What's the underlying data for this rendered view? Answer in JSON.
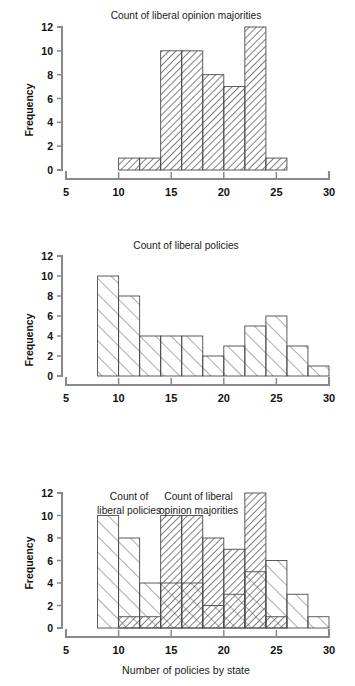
{
  "figure": {
    "xlabel": "Number of policies by state",
    "ylabel": "Frequency",
    "series_names": {
      "policies": "Count of liberal policies",
      "majorities": "Count of liberal opinion majorities"
    },
    "colors": {
      "ink": "#111111",
      "axis": "#8a8a8a",
      "bar_stroke": "#4a4a4a"
    }
  },
  "chart_data": [
    {
      "type": "bar",
      "id": "panel-1",
      "title": "Count of liberal opinion majorities",
      "xlabel": "",
      "ylabel": "Frequency",
      "xlim": [
        5,
        30
      ],
      "ylim": [
        0,
        12
      ],
      "xticks": [
        5,
        10,
        15,
        20,
        25,
        30
      ],
      "yticks": [
        0,
        2,
        4,
        6,
        8,
        10,
        12
      ],
      "xtick_labels": [
        "5",
        "10",
        "15",
        "20",
        "25",
        "30"
      ],
      "ytick_labels": [
        "0",
        "2",
        "4",
        "6",
        "8",
        "10",
        "12"
      ],
      "grid": false,
      "legend": "none",
      "bin_width": 2,
      "bin_edges": [
        10,
        12,
        14,
        16,
        18,
        20,
        22,
        24,
        26
      ],
      "categories": [
        "10-12",
        "12-14",
        "14-16",
        "16-18",
        "18-20",
        "20-22",
        "22-24",
        "24-26"
      ],
      "values": [
        1,
        1,
        10,
        10,
        8,
        7,
        12,
        1
      ],
      "hatch": "dense-backslash"
    },
    {
      "type": "bar",
      "id": "panel-2",
      "title": "Count of liberal policies",
      "xlabel": "",
      "ylabel": "Frequency",
      "xlim": [
        5,
        30
      ],
      "ylim": [
        0,
        12
      ],
      "xticks": [
        5,
        10,
        15,
        20,
        25,
        30
      ],
      "yticks": [
        0,
        2,
        4,
        6,
        8,
        10,
        12
      ],
      "xtick_labels": [
        "5",
        "10",
        "15",
        "20",
        "25",
        "30"
      ],
      "ytick_labels": [
        "0",
        "2",
        "4",
        "6",
        "8",
        "10",
        "12"
      ],
      "grid": false,
      "legend": "none",
      "bin_width": 2,
      "bin_edges": [
        8,
        10,
        12,
        14,
        16,
        18,
        20,
        22,
        24,
        26,
        28,
        30
      ],
      "categories": [
        "8-10",
        "10-12",
        "12-14",
        "14-16",
        "16-18",
        "18-20",
        "20-22",
        "22-24",
        "24-26",
        "26-28",
        "28-30"
      ],
      "values": [
        10,
        8,
        4,
        4,
        4,
        2,
        3,
        5,
        6,
        3,
        1
      ],
      "hatch": "sparse-slash"
    },
    {
      "type": "bar",
      "id": "panel-3",
      "title": "",
      "xlabel": "Number of policies by state",
      "ylabel": "Frequency",
      "xlim": [
        5,
        30
      ],
      "ylim": [
        0,
        12
      ],
      "xticks": [
        5,
        10,
        15,
        20,
        25,
        30
      ],
      "yticks": [
        0,
        2,
        4,
        6,
        8,
        10,
        12
      ],
      "xtick_labels": [
        "5",
        "10",
        "15",
        "20",
        "25",
        "30"
      ],
      "ytick_labels": [
        "0",
        "2",
        "4",
        "6",
        "8",
        "10",
        "12"
      ],
      "grid": false,
      "legend": "inline-annotations",
      "bin_width": 2,
      "annotations": [
        {
          "text_line1": "Count of",
          "text_line2": "liberal policies",
          "x": 11.0,
          "y": 11.4
        },
        {
          "text_line1": "Count of liberal",
          "text_line2": "opinion majorities",
          "x": 17.6,
          "y": 11.4
        }
      ],
      "series": [
        {
          "name": "Count of liberal policies",
          "hatch": "sparse-slash",
          "bin_edges": [
            8,
            10,
            12,
            14,
            16,
            18,
            20,
            22,
            24,
            26,
            28,
            30
          ],
          "categories": [
            "8-10",
            "10-12",
            "12-14",
            "14-16",
            "16-18",
            "18-20",
            "20-22",
            "22-24",
            "24-26",
            "26-28",
            "28-30"
          ],
          "values": [
            10,
            8,
            4,
            4,
            4,
            2,
            3,
            5,
            6,
            3,
            1
          ]
        },
        {
          "name": "Count of liberal opinion majorities",
          "hatch": "dense-backslash",
          "bin_edges": [
            10,
            12,
            14,
            16,
            18,
            20,
            22,
            24,
            26
          ],
          "categories": [
            "10-12",
            "12-14",
            "14-16",
            "16-18",
            "18-20",
            "20-22",
            "22-24",
            "24-26"
          ],
          "values": [
            1,
            1,
            10,
            10,
            8,
            7,
            12,
            1
          ]
        }
      ]
    }
  ]
}
